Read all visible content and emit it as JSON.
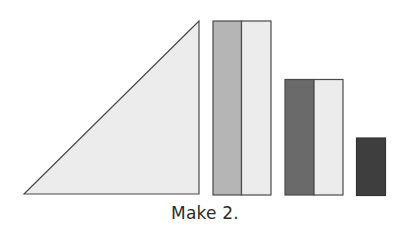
{
  "caption": "Make 2.",
  "colors": {
    "outline": "#4a4a4a",
    "light": "#ececec",
    "medium": "#b5b5b5",
    "dark": "#6a6a6a",
    "darkest": "#3e3e3e"
  },
  "shapes": [
    {
      "id": "triangle",
      "type": "right-triangle",
      "fill": "light"
    },
    {
      "id": "tall-rectangle",
      "type": "rectangle",
      "parts": [
        "medium",
        "light"
      ]
    },
    {
      "id": "medium-rectangle",
      "type": "rectangle",
      "parts": [
        "dark",
        "light"
      ]
    },
    {
      "id": "small-rectangle",
      "type": "rectangle",
      "parts": [
        "darkest"
      ]
    }
  ]
}
